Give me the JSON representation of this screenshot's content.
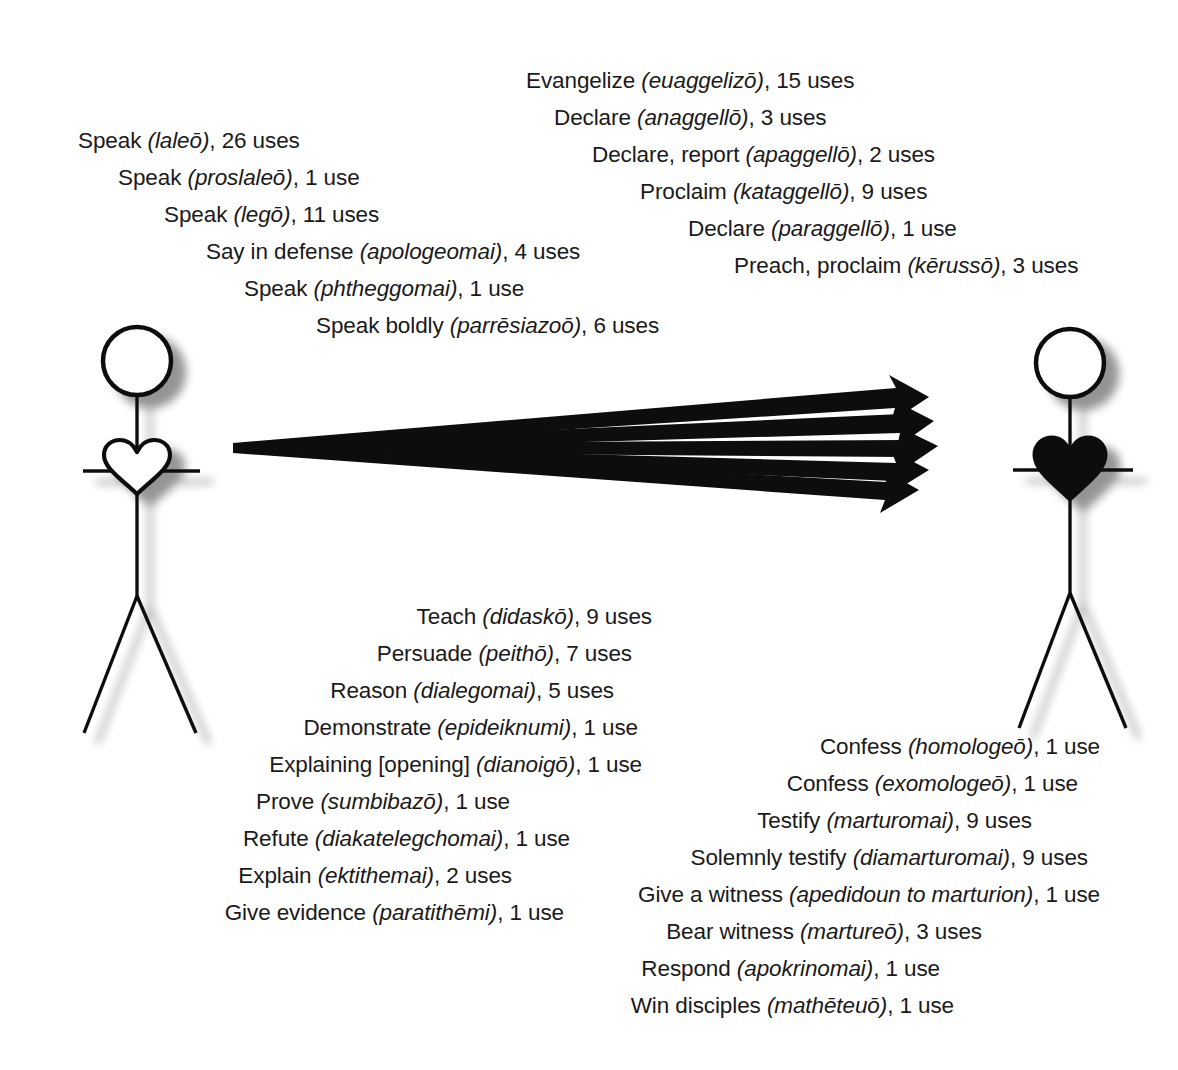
{
  "diagram": {
    "heart_outline_color": "#000000",
    "heart_filled_color": "#000000",
    "stroke_color": "#111111",
    "arrow_color": "#000000",
    "background": "#ffffff",
    "arrow_count": 5,
    "figures": [
      {
        "name": "speaker",
        "side": "left",
        "heart": "outline"
      },
      {
        "name": "hearer",
        "side": "right",
        "heart": "filled"
      }
    ]
  },
  "blocks": {
    "speak": {
      "name": "speaking-terms",
      "lines": [
        {
          "english": "Speak",
          "greek": "laleō",
          "count": "26 uses"
        },
        {
          "english": "Speak",
          "greek": "proslaleō",
          "count": "1 use"
        },
        {
          "english": "Speak",
          "greek": "legō",
          "count": "11 uses"
        },
        {
          "english": "Say in defense",
          "greek": "apologeomai",
          "count": "4 uses"
        },
        {
          "english": "Speak",
          "greek": "phtheggomai",
          "count": "1 use"
        },
        {
          "english": "Speak boldly",
          "greek": "parrēsiazoō",
          "count": "6 uses"
        }
      ]
    },
    "proclaim": {
      "name": "proclaiming-terms",
      "lines": [
        {
          "english": "Evangelize",
          "greek": "euaggelizō",
          "count": "15 uses"
        },
        {
          "english": "Declare",
          "greek": "anaggellō",
          "count": "3 uses"
        },
        {
          "english": "Declare, report",
          "greek": "apaggellō",
          "count": "2 uses"
        },
        {
          "english": "Proclaim",
          "greek": "kataggellō",
          "count": "9 uses"
        },
        {
          "english": "Declare",
          "greek": "paraggellō",
          "count": "1 use"
        },
        {
          "english": "Preach, proclaim",
          "greek": "kērussō",
          "count": "3 uses"
        }
      ]
    },
    "teach": {
      "name": "teaching-terms",
      "lines": [
        {
          "english": "Teach",
          "greek": "didaskō",
          "count": "9 uses"
        },
        {
          "english": "Persuade",
          "greek": "peithō",
          "count": "7 uses"
        },
        {
          "english": "Reason",
          "greek": "dialegomai",
          "count": "5 uses"
        },
        {
          "english": "Demonstrate",
          "greek": "epideiknumi",
          "count": "1 use"
        },
        {
          "english": "Explaining [opening]",
          "greek": "dianoigō",
          "count": "1 use"
        },
        {
          "english": "Prove",
          "greek": "sumbibazō",
          "count": "1 use"
        },
        {
          "english": "Refute",
          "greek": "diakatelegchomai",
          "count": "1 use"
        },
        {
          "english": "Explain",
          "greek": "ektithemai",
          "count": "2 uses"
        },
        {
          "english": "Give evidence",
          "greek": "paratithēmi",
          "count": "1 use"
        }
      ]
    },
    "witness": {
      "name": "witnessing-terms",
      "lines": [
        {
          "english": "Confess",
          "greek": "homologeō",
          "count": "1 use"
        },
        {
          "english": "Confess",
          "greek": "exomologeō",
          "count": "1 use"
        },
        {
          "english": "Testify",
          "greek": "marturomai",
          "count": "9 uses"
        },
        {
          "english": "Solemnly testify",
          "greek": "diamarturomai",
          "count": "9 uses"
        },
        {
          "english": "Give a witness",
          "greek": "apedidoun to marturion",
          "count": "1 use"
        },
        {
          "english": "Bear witness",
          "greek": "martureō",
          "count": "3 uses"
        },
        {
          "english": "Respond",
          "greek": "apokrinomai",
          "count": "1 use"
        },
        {
          "english": "Win disciples",
          "greek": "mathēteuō",
          "count": "1 use"
        }
      ]
    }
  }
}
